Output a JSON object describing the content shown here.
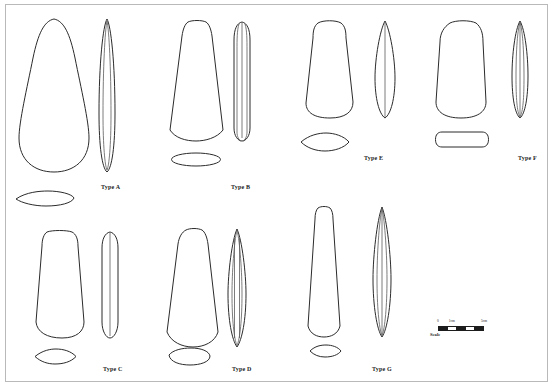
{
  "plate": {
    "width": 558,
    "height": 385,
    "background_color": "#ffffff",
    "stroke_color": "#2b2b2b",
    "frame_color": "#b9b9b9",
    "description": "Line-drawing plate of seven stone adze/axe types, each shown in front view, side view and cross-section"
  },
  "types": [
    {
      "id": "a",
      "label": "Type A",
      "label_x": 101,
      "label_y": 184,
      "front": {
        "x": 16,
        "y": 18,
        "w": 76,
        "h": 155
      },
      "side": {
        "x": 97,
        "y": 18,
        "w": 20,
        "h": 155
      },
      "section": {
        "x": 14,
        "y": 190,
        "w": 62,
        "h": 17
      },
      "front_shape": "rounded-wedge-teardrop",
      "side_shape": "narrow-lens-with-inner-line",
      "section_shape": "flat-lens"
    },
    {
      "id": "b",
      "label": "Type B",
      "label_x": 231,
      "label_y": 184,
      "front": {
        "x": 167,
        "y": 20,
        "w": 60,
        "h": 122
      },
      "side": {
        "x": 232,
        "y": 20,
        "w": 20,
        "h": 122
      },
      "section": {
        "x": 170,
        "y": 152,
        "w": 52,
        "h": 15
      },
      "front_shape": "tapered-trapezoid-round-butt",
      "side_shape": "narrow-parallel-sided-with-inner-lines",
      "section_shape": "flat-ellipse"
    },
    {
      "id": "c",
      "label": "Type C",
      "label_x": 103,
      "label_y": 366,
      "front": {
        "x": 29,
        "y": 230,
        "w": 62,
        "h": 110
      },
      "side": {
        "x": 99,
        "y": 230,
        "w": 22,
        "h": 110
      },
      "section": {
        "x": 33,
        "y": 348,
        "w": 45,
        "h": 17
      },
      "front_shape": "rounded-trapezoid",
      "side_shape": "narrow-rounded-with-centre-line",
      "section_shape": "lenticular"
    },
    {
      "id": "d",
      "label": "Type D",
      "label_x": 232,
      "label_y": 366,
      "front": {
        "x": 163,
        "y": 228,
        "w": 60,
        "h": 120
      },
      "side": {
        "x": 225,
        "y": 228,
        "w": 24,
        "h": 120
      },
      "section": {
        "x": 167,
        "y": 348,
        "w": 45,
        "h": 18
      },
      "front_shape": "tapered-trapezoid-round-butt",
      "side_shape": "pointed-lens-with-parallel-inner-lines",
      "section_shape": "rounded-ellipse"
    },
    {
      "id": "e",
      "label": "Type E",
      "label_x": 364,
      "label_y": 155,
      "front": {
        "x": 301,
        "y": 20,
        "w": 58,
        "h": 100
      },
      "side": {
        "x": 372,
        "y": 20,
        "w": 26,
        "h": 100
      },
      "section": {
        "x": 299,
        "y": 132,
        "w": 52,
        "h": 20
      },
      "front_shape": "rounded-trapezoid",
      "side_shape": "pointed-lens-with-centre-line",
      "section_shape": "lenticular"
    },
    {
      "id": "f",
      "label": "Type F",
      "label_x": 518,
      "label_y": 155,
      "front": {
        "x": 432,
        "y": 20,
        "w": 60,
        "h": 100
      },
      "side": {
        "x": 509,
        "y": 20,
        "w": 22,
        "h": 100
      },
      "section": {
        "x": 434,
        "y": 131,
        "w": 56,
        "h": 17
      },
      "front_shape": "broad-rounded-rectangle",
      "side_shape": "pointed-lens-with-inner-lines",
      "section_shape": "rounded-rectangle"
    },
    {
      "id": "g",
      "label": "Type G",
      "label_x": 372,
      "label_y": 366,
      "front": {
        "x": 305,
        "y": 206,
        "w": 38,
        "h": 132
      },
      "side": {
        "x": 370,
        "y": 206,
        "w": 24,
        "h": 132
      },
      "section": {
        "x": 308,
        "y": 344,
        "w": 35,
        "h": 14
      },
      "front_shape": "narrow-elongated-trapezoid",
      "side_shape": "slender-pointed-lens-with-inner-line",
      "section_shape": "lenticular"
    }
  ],
  "scale_bar": {
    "caption": "Scale",
    "ticks": [
      {
        "label": "0",
        "position_pct": 0
      },
      {
        "label": "1cm",
        "position_pct": 30
      },
      {
        "label": "5cm",
        "position_pct": 100
      }
    ],
    "segments": 5,
    "bar_color": "#1c1c1c"
  }
}
